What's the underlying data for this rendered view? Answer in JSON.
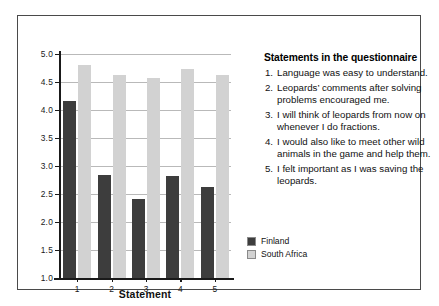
{
  "chart_data": {
    "type": "bar",
    "title": "",
    "xlabel": "Statement",
    "ylabel": "",
    "categories": [
      "1",
      "2",
      "3",
      "4",
      "5"
    ],
    "ylim": [
      1.0,
      5.0
    ],
    "ytick_labels": [
      "1.0",
      "1.5",
      "2.0",
      "2.5",
      "3.0",
      "3.5",
      "4.0",
      "4.5",
      "5.0"
    ],
    "ytick_values": [
      1.0,
      1.5,
      2.0,
      2.5,
      3.0,
      3.5,
      4.0,
      4.5,
      5.0
    ],
    "grid": true,
    "legend_position": "center-right",
    "series": [
      {
        "name": "Finland",
        "color": "#3d3d3d",
        "values": [
          4.16,
          2.84,
          2.41,
          2.82,
          2.62
        ]
      },
      {
        "name": "South Africa",
        "color": "#d2d2d2",
        "values": [
          4.8,
          4.62,
          4.58,
          4.74,
          4.62
        ]
      }
    ]
  },
  "statements": {
    "heading": "Statements in the questionnaire",
    "items": [
      {
        "num": "1.",
        "text": "Language was easy to understand."
      },
      {
        "num": "2.",
        "text": "Leopards’ comments after solving problems encouraged me."
      },
      {
        "num": "3.",
        "text": "I will think of leopards from now on whenever I do fractions."
      },
      {
        "num": "4.",
        "text": "I would also like to meet other wild animals in the game and help them."
      },
      {
        "num": "5.",
        "text": "I felt important as I was saving the leopards."
      }
    ]
  }
}
